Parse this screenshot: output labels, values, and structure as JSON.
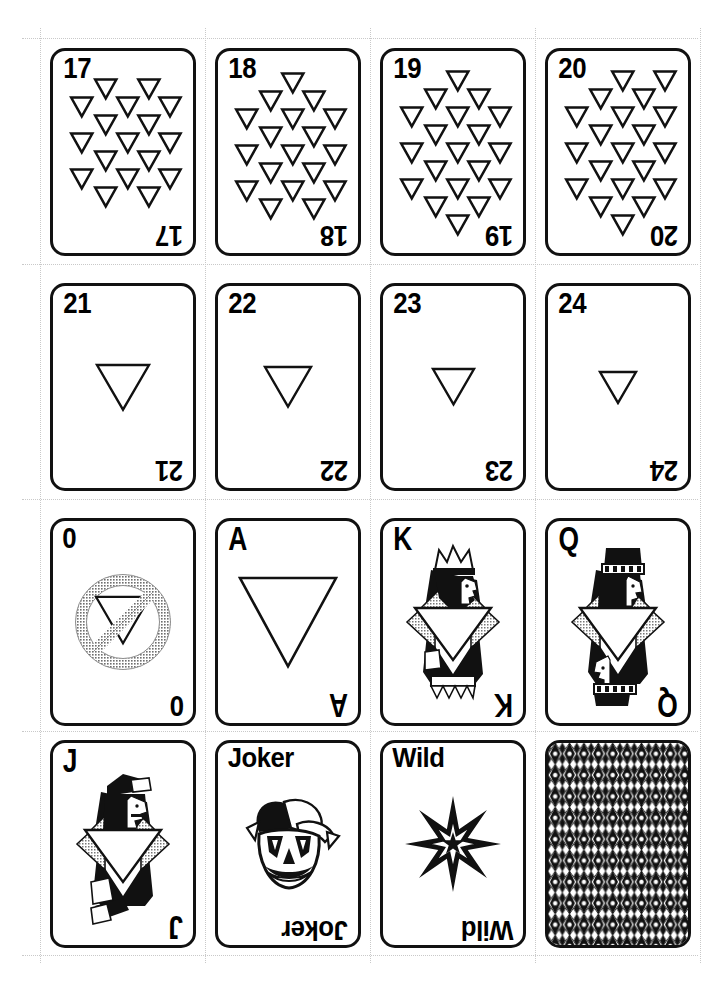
{
  "sheet": {
    "title": "Triangle Suit Playing Card Sheet",
    "width": 719,
    "height": 982,
    "background": "#ffffff",
    "ink": "#111111",
    "shade": "#b8b8b8",
    "columns": 4,
    "rows": 4,
    "card_width": 146,
    "card_height": 208,
    "col_x": [
      50,
      215,
      380,
      545
    ],
    "row_y": [
      48,
      283,
      518,
      740
    ],
    "cut_guides": {
      "visible": true,
      "color": "#c9c9c9",
      "style": "dotted",
      "horizontal_y": [
        38,
        264,
        499,
        731,
        955
      ],
      "vertical_x": [
        40,
        205,
        370,
        535,
        700
      ]
    }
  },
  "suit": {
    "name": "triangle",
    "shape": "down-triangle",
    "fill": "#ffffff",
    "stroke": "#111111"
  },
  "cards": [
    {
      "id": "card-17",
      "rank": "17",
      "rank_class": "num",
      "type": "pip",
      "pip_count": 17,
      "pip_size": 22,
      "row": 0,
      "col": 0,
      "pips": [
        [
          55,
          22
        ],
        [
          100,
          22
        ],
        [
          30,
          40
        ],
        [
          78,
          40
        ],
        [
          122,
          40
        ],
        [
          55,
          58
        ],
        [
          100,
          58
        ],
        [
          30,
          76
        ],
        [
          78,
          76
        ],
        [
          122,
          76
        ],
        [
          55,
          94
        ],
        [
          100,
          94
        ],
        [
          30,
          112
        ],
        [
          78,
          112
        ],
        [
          122,
          112
        ],
        [
          55,
          130
        ],
        [
          100,
          130
        ]
      ]
    },
    {
      "id": "card-18",
      "rank": "18",
      "rank_class": "num",
      "type": "pip",
      "pip_count": 18,
      "pip_size": 22,
      "row": 0,
      "col": 1,
      "pips": [
        [
          78,
          16
        ],
        [
          55,
          34
        ],
        [
          100,
          34
        ],
        [
          30,
          52
        ],
        [
          78,
          52
        ],
        [
          122,
          52
        ],
        [
          55,
          70
        ],
        [
          100,
          70
        ],
        [
          30,
          88
        ],
        [
          78,
          88
        ],
        [
          122,
          88
        ],
        [
          55,
          106
        ],
        [
          100,
          106
        ],
        [
          30,
          124
        ],
        [
          78,
          124
        ],
        [
          122,
          124
        ],
        [
          55,
          142
        ],
        [
          100,
          142
        ]
      ]
    },
    {
      "id": "card-19",
      "rank": "19",
      "rank_class": "num",
      "type": "pip",
      "pip_count": 19,
      "pip_size": 22,
      "row": 0,
      "col": 2,
      "pips": [
        [
          78,
          14
        ],
        [
          55,
          32
        ],
        [
          100,
          32
        ],
        [
          30,
          50
        ],
        [
          78,
          50
        ],
        [
          122,
          50
        ],
        [
          55,
          68
        ],
        [
          100,
          68
        ],
        [
          30,
          86
        ],
        [
          78,
          86
        ],
        [
          122,
          86
        ],
        [
          55,
          104
        ],
        [
          100,
          104
        ],
        [
          30,
          122
        ],
        [
          78,
          122
        ],
        [
          122,
          122
        ],
        [
          55,
          140
        ],
        [
          100,
          140
        ],
        [
          78,
          158
        ]
      ]
    },
    {
      "id": "card-20",
      "rank": "20",
      "rank_class": "num",
      "type": "pip",
      "pip_count": 20,
      "pip_size": 22,
      "row": 0,
      "col": 3,
      "pips": [
        [
          78,
          14
        ],
        [
          122,
          14
        ],
        [
          55,
          32
        ],
        [
          100,
          32
        ],
        [
          30,
          50
        ],
        [
          78,
          50
        ],
        [
          122,
          50
        ],
        [
          55,
          68
        ],
        [
          100,
          68
        ],
        [
          30,
          86
        ],
        [
          78,
          86
        ],
        [
          122,
          86
        ],
        [
          55,
          104
        ],
        [
          100,
          104
        ],
        [
          30,
          122
        ],
        [
          78,
          122
        ],
        [
          122,
          122
        ],
        [
          55,
          140
        ],
        [
          100,
          140
        ],
        [
          78,
          158
        ]
      ]
    },
    {
      "id": "card-21",
      "rank": "21",
      "rank_class": "num",
      "type": "single",
      "row": 1,
      "col": 0,
      "art_size": 52
    },
    {
      "id": "card-22",
      "rank": "22",
      "rank_class": "num",
      "type": "single",
      "row": 1,
      "col": 1,
      "art_size": 46
    },
    {
      "id": "card-23",
      "rank": "23",
      "rank_class": "num",
      "type": "single",
      "row": 1,
      "col": 2,
      "art_size": 41
    },
    {
      "id": "card-24",
      "rank": "24",
      "rank_class": "num",
      "type": "single",
      "row": 1,
      "col": 3,
      "art_size": 36
    },
    {
      "id": "card-0",
      "rank": "0",
      "rank_class": "num",
      "type": "zero",
      "row": 2,
      "col": 0,
      "art_label": "no-triangle-symbol",
      "art_size": 100
    },
    {
      "id": "card-A",
      "rank": "A",
      "rank_class": "letter",
      "type": "ace",
      "row": 2,
      "col": 1,
      "art_size": 96
    },
    {
      "id": "card-K",
      "rank": "K",
      "rank_class": "letter",
      "type": "court",
      "court": "king",
      "row": 2,
      "col": 2
    },
    {
      "id": "card-Q",
      "rank": "Q",
      "rank_class": "letter",
      "type": "court",
      "court": "queen",
      "row": 2,
      "col": 3
    },
    {
      "id": "card-J",
      "rank": "J",
      "rank_class": "letter",
      "type": "court",
      "court": "jack",
      "row": 3,
      "col": 0
    },
    {
      "id": "card-joker",
      "rank": "Joker",
      "rank_class": "word",
      "type": "joker",
      "row": 3,
      "col": 1,
      "art_label": "jester-face"
    },
    {
      "id": "card-wild",
      "rank": "Wild",
      "rank_class": "word",
      "type": "wild",
      "row": 3,
      "col": 2,
      "art_label": "eight-point-star"
    },
    {
      "id": "card-back",
      "rank": "",
      "rank_class": "num",
      "type": "back",
      "row": 3,
      "col": 3,
      "art_label": "diamond-lattice-pattern"
    }
  ]
}
